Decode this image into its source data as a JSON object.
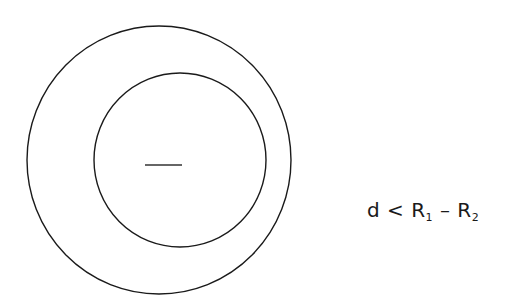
{
  "diagram": {
    "outer_circle": {
      "cx": 159,
      "cy": 160,
      "rx": 132,
      "ry": 134,
      "stroke": "#1a1a1a"
    },
    "inner_circle": {
      "cx": 180,
      "cy": 160,
      "rx": 86,
      "ry": 87,
      "stroke": "#1a1a1a"
    },
    "center_dash": {
      "x1": 145,
      "y1": 165,
      "x2": 182,
      "y2": 165,
      "stroke": "#333333"
    },
    "formula": {
      "lhs": "d",
      "op1": "<",
      "r1_base": "R",
      "r1_sub": "1",
      "op2": "–",
      "r2_base": "R",
      "r2_sub": "2"
    }
  }
}
